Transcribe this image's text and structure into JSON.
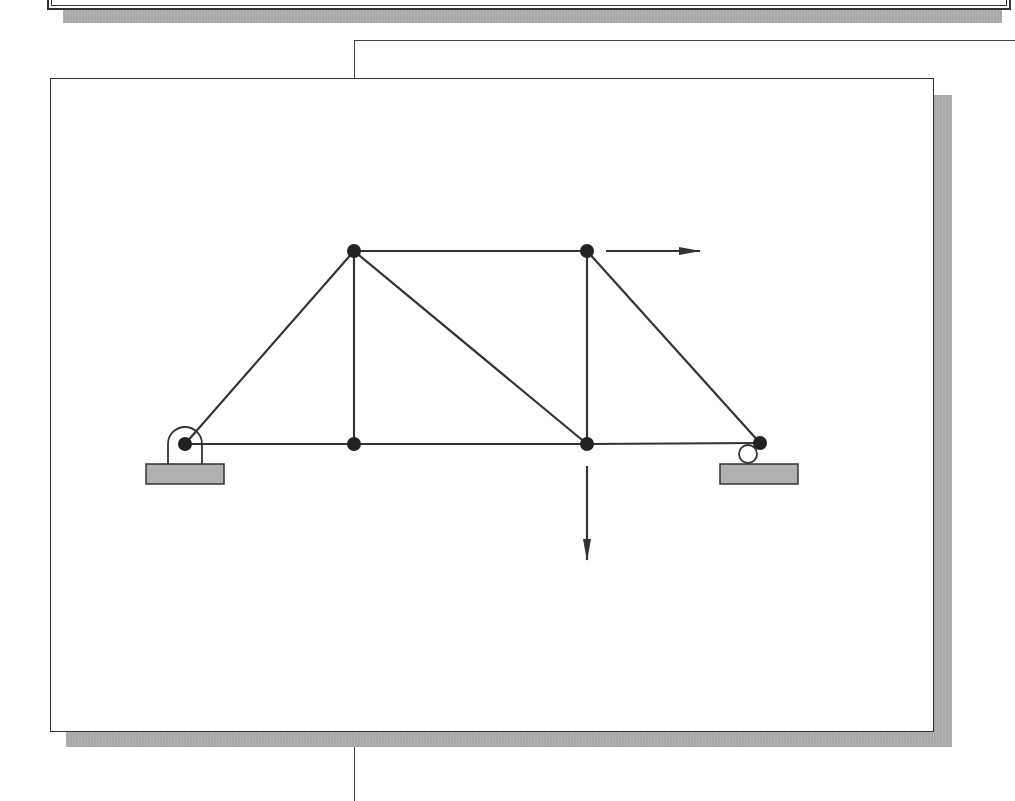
{
  "diagram": {
    "type": "truss",
    "colors": {
      "member": "#333333",
      "joint": "#222222",
      "support_base_fill": "#b0b0b0",
      "shadow": "#a8a8a8",
      "background": "#ffffff"
    },
    "joints": [
      {
        "id": "A",
        "x": 185,
        "y": 444,
        "support": "pin"
      },
      {
        "id": "B",
        "x": 354,
        "y": 444
      },
      {
        "id": "C",
        "x": 587,
        "y": 444
      },
      {
        "id": "D",
        "x": 760,
        "y": 443,
        "support": "roller"
      },
      {
        "id": "E",
        "x": 354,
        "y": 251
      },
      {
        "id": "F",
        "x": 587,
        "y": 251
      }
    ],
    "members": [
      [
        "A",
        "B"
      ],
      [
        "B",
        "C"
      ],
      [
        "C",
        "D"
      ],
      [
        "E",
        "F"
      ],
      [
        "A",
        "E"
      ],
      [
        "B",
        "E"
      ],
      [
        "E",
        "C"
      ],
      [
        "C",
        "F"
      ],
      [
        "F",
        "D"
      ]
    ],
    "loads": [
      {
        "joint": "F",
        "direction": "right",
        "x1": 606,
        "y1": 251,
        "x2": 700,
        "y2": 251
      },
      {
        "joint": "C",
        "direction": "down",
        "x1": 587,
        "y1": 466,
        "x2": 587,
        "y2": 560
      }
    ],
    "supports": [
      {
        "type": "pin",
        "joint": "A",
        "base": {
          "x": 146,
          "y": 464,
          "w": 78,
          "h": 20
        }
      },
      {
        "type": "roller",
        "joint": "D",
        "base": {
          "x": 720,
          "y": 464,
          "w": 78,
          "h": 20
        }
      }
    ]
  }
}
